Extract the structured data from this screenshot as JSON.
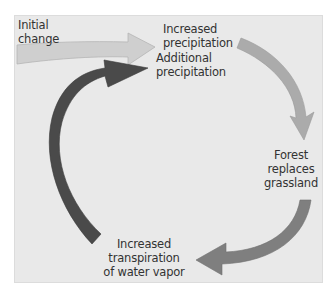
{
  "diagram": {
    "title": "",
    "type": "positive-feedback-loop",
    "background_color": "#e9e9e9",
    "nodes": [
      {
        "id": "initial",
        "lines": [
          "Initial",
          "change"
        ]
      },
      {
        "id": "increased_precipitation",
        "lines": [
          "Increased",
          "precipitation"
        ]
      },
      {
        "id": "forest",
        "lines": [
          "Forest",
          "replaces",
          "grassland"
        ]
      },
      {
        "id": "transpiration",
        "lines": [
          "Increased",
          "transpiration",
          "of water vapor"
        ]
      },
      {
        "id": "additional_precipitation",
        "lines": [
          "Additional",
          "precipitation"
        ]
      }
    ],
    "edges": [
      {
        "from": "initial",
        "to": "increased_precipitation",
        "color": "#c8c8c8"
      },
      {
        "from": "increased_precipitation",
        "to": "forest",
        "color": "#a9a9a9"
      },
      {
        "from": "forest",
        "to": "transpiration",
        "color": "#808080"
      },
      {
        "from": "transpiration",
        "to": "additional_precipitation",
        "color": "#4a4a4a"
      }
    ]
  }
}
